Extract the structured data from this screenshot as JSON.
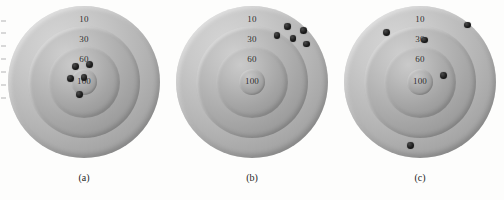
{
  "figure": {
    "background_color": "#fdfdfc",
    "ring_label_color": "#2b2b2b",
    "shot_color": "#141414"
  },
  "ring_scores": {
    "outer": "10",
    "second": "30",
    "third": "60",
    "bullseye": "100"
  },
  "panels": [
    {
      "id": "a",
      "caption": "(a)",
      "shot_count": 5,
      "shots": [
        {
          "x": 44.5,
          "y": 40.0,
          "r": 3.4
        },
        {
          "x": 53.5,
          "y": 38.5,
          "r": 3.6
        },
        {
          "x": 41.0,
          "y": 47.5,
          "r": 3.6
        },
        {
          "x": 50.0,
          "y": 47.0,
          "r": 3.2
        },
        {
          "x": 47.0,
          "y": 58.0,
          "r": 3.4
        }
      ]
    },
    {
      "id": "b",
      "caption": "(b)",
      "shot_count": 5,
      "shots": [
        {
          "x": 73.5,
          "y": 13.5,
          "r": 3.3
        },
        {
          "x": 84.0,
          "y": 16.0,
          "r": 3.3
        },
        {
          "x": 66.5,
          "y": 19.5,
          "r": 3.3
        },
        {
          "x": 77.0,
          "y": 21.5,
          "r": 3.3
        },
        {
          "x": 86.0,
          "y": 25.0,
          "r": 3.3
        }
      ]
    },
    {
      "id": "c",
      "caption": "(c)",
      "shot_count": 5,
      "shots": [
        {
          "x": 28.0,
          "y": 17.5,
          "r": 3.4
        },
        {
          "x": 81.5,
          "y": 12.5,
          "r": 3.4
        },
        {
          "x": 53.0,
          "y": 22.5,
          "r": 3.2
        },
        {
          "x": 65.5,
          "y": 45.5,
          "r": 3.4
        },
        {
          "x": 44.0,
          "y": 92.0,
          "r": 3.4
        }
      ]
    }
  ],
  "chart_data": {
    "type": "scatter",
    "title": "",
    "ring_scores": [
      10,
      30,
      60,
      100
    ],
    "ring_radii_px": [
      76,
      56,
      36,
      13
    ],
    "panels": [
      {
        "label": "(a)",
        "x": [
          44.5,
          53.5,
          41.0,
          50.0,
          47.0
        ],
        "y": [
          40.0,
          38.5,
          47.5,
          47.0,
          58.0
        ],
        "n": 5
      },
      {
        "label": "(b)",
        "x": [
          73.5,
          84.0,
          66.5,
          77.0,
          86.0
        ],
        "y": [
          13.5,
          16.0,
          19.5,
          21.5,
          25.0
        ],
        "n": 5
      },
      {
        "label": "(c)",
        "x": [
          28.0,
          81.5,
          53.0,
          65.5,
          44.0
        ],
        "y": [
          17.5,
          12.5,
          22.5,
          45.5,
          92.0
        ],
        "n": 5
      }
    ],
    "xlabel": "",
    "ylabel": "",
    "grid": false,
    "legend": "none"
  }
}
